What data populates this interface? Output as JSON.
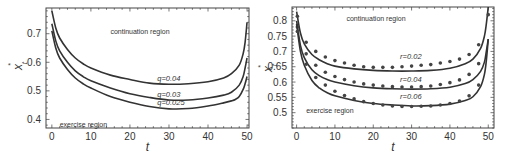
{
  "chart_data": [
    {
      "type": "line",
      "title": "",
      "xlabel": "t",
      "ylabel": "x_t^*",
      "xlim": [
        -1.5,
        50.5
      ],
      "ylim": [
        0.37,
        0.79
      ],
      "xticks": [
        0,
        10,
        20,
        30,
        40,
        50
      ],
      "yticks": [
        0.4,
        0.5,
        0.6,
        0.7
      ],
      "ytick_labels": [
        "0.4",
        "0.5",
        "0.6",
        "0.7"
      ],
      "xtick_labels": [
        "0",
        "10",
        "20",
        "30",
        "40",
        "50"
      ],
      "grid": false,
      "annotations": [
        {
          "text": "continuation region",
          "x": 15,
          "y": 0.7
        },
        {
          "text": "exercise region",
          "x": 2,
          "y": 0.375
        }
      ],
      "series": [
        {
          "name": "q=0.04",
          "label_pos": {
            "x": 27,
            "y": 0.535
          },
          "x": [
            0,
            1,
            2,
            4,
            6,
            8,
            10,
            15,
            20,
            25,
            30,
            35,
            40,
            44,
            46,
            48,
            49,
            49.5,
            50
          ],
          "values": [
            0.78,
            0.72,
            0.685,
            0.645,
            0.615,
            0.595,
            0.58,
            0.555,
            0.54,
            0.527,
            0.523,
            0.525,
            0.532,
            0.545,
            0.56,
            0.59,
            0.63,
            0.67,
            0.74
          ]
        },
        {
          "name": "q=0.03",
          "label_pos": {
            "x": 27,
            "y": 0.48
          },
          "x": [
            0,
            1,
            2,
            4,
            6,
            8,
            10,
            15,
            20,
            25,
            30,
            35,
            40,
            44,
            46,
            48,
            49,
            49.5,
            50
          ],
          "values": [
            0.735,
            0.675,
            0.64,
            0.6,
            0.57,
            0.55,
            0.535,
            0.51,
            0.49,
            0.477,
            0.468,
            0.468,
            0.475,
            0.485,
            0.495,
            0.52,
            0.55,
            0.58,
            0.615
          ]
        },
        {
          "name": "q=0.025",
          "label_pos": {
            "x": 27,
            "y": 0.452
          },
          "x": [
            0,
            1,
            2,
            4,
            6,
            8,
            10,
            15,
            20,
            25,
            30,
            35,
            40,
            44,
            46,
            47,
            48,
            49,
            49.5,
            50
          ],
          "values": [
            0.71,
            0.65,
            0.615,
            0.575,
            0.545,
            0.525,
            0.51,
            0.48,
            0.46,
            0.445,
            0.437,
            0.438,
            0.447,
            0.458,
            0.465,
            0.47,
            0.48,
            0.505,
            0.525,
            0.55
          ]
        }
      ]
    },
    {
      "type": "line",
      "title": "",
      "xlabel": "t",
      "ylabel": "x_t^*",
      "xlim": [
        -1.2,
        51.5
      ],
      "ylim": [
        0.45,
        0.845
      ],
      "xticks": [
        0,
        10,
        20,
        30,
        40,
        50
      ],
      "yticks": [
        0.5,
        0.55,
        0.6,
        0.65,
        0.7,
        0.75,
        0.8
      ],
      "ytick_labels": [
        "0.5",
        "0.55",
        "0.6",
        "0.65",
        "0.7",
        "0.75",
        "0.8"
      ],
      "xtick_labels": [
        "0",
        "10",
        "20",
        "30",
        "40",
        "50"
      ],
      "grid": false,
      "annotations": [
        {
          "text": "continuation region",
          "x": 13,
          "y": 0.8
        },
        {
          "text": "exercise region",
          "x": 2.5,
          "y": 0.5
        }
      ],
      "series": [
        {
          "name": "r=0.02",
          "label_pos": {
            "x": 27,
            "y": 0.675
          },
          "x": [
            0,
            1,
            2,
            4,
            6,
            8,
            10,
            15,
            20,
            25,
            30,
            35,
            40,
            44,
            46,
            48,
            49,
            49.5,
            50
          ],
          "values": [
            0.83,
            0.76,
            0.725,
            0.69,
            0.672,
            0.66,
            0.652,
            0.643,
            0.638,
            0.636,
            0.636,
            0.638,
            0.645,
            0.66,
            0.675,
            0.71,
            0.75,
            0.79,
            0.845
          ],
          "markers_x": [
            0.2,
            2.5,
            5,
            7.5,
            10,
            12.5,
            15,
            17.5,
            20,
            22.5,
            25,
            27.5,
            30,
            32.5,
            35,
            37.5,
            40,
            42.5,
            45,
            47.5,
            50
          ],
          "markers_y": [
            0.815,
            0.73,
            0.7,
            0.682,
            0.67,
            0.662,
            0.655,
            0.65,
            0.648,
            0.648,
            0.648,
            0.65,
            0.652,
            0.655,
            0.657,
            0.662,
            0.667,
            0.675,
            0.69,
            0.722,
            0.82
          ]
        },
        {
          "name": "r=0.04",
          "label_pos": {
            "x": 27,
            "y": 0.6
          },
          "x": [
            0,
            1,
            2,
            4,
            6,
            8,
            10,
            15,
            20,
            25,
            30,
            35,
            40,
            44,
            46,
            48,
            49,
            49.5,
            50
          ],
          "values": [
            0.8,
            0.72,
            0.68,
            0.64,
            0.62,
            0.608,
            0.6,
            0.588,
            0.581,
            0.578,
            0.577,
            0.578,
            0.583,
            0.595,
            0.608,
            0.635,
            0.665,
            0.7,
            0.74
          ],
          "markers_x": [
            0.2,
            2.5,
            5,
            7.5,
            10,
            12.5,
            15,
            17.5,
            20,
            22.5,
            25,
            27.5,
            30,
            32.5,
            35,
            37.5,
            40,
            42.5,
            45,
            47.5
          ],
          "markers_y": [
            0.78,
            0.692,
            0.655,
            0.632,
            0.618,
            0.608,
            0.6,
            0.594,
            0.59,
            0.587,
            0.585,
            0.584,
            0.584,
            0.585,
            0.587,
            0.592,
            0.598,
            0.607,
            0.625,
            0.66
          ]
        },
        {
          "name": "r=0.06",
          "label_pos": {
            "x": 27,
            "y": 0.545
          },
          "x": [
            0,
            1,
            2,
            4,
            6,
            8,
            10,
            15,
            20,
            25,
            30,
            35,
            40,
            44,
            46,
            48,
            49,
            49.5,
            50
          ],
          "values": [
            0.79,
            0.7,
            0.655,
            0.605,
            0.58,
            0.565,
            0.555,
            0.54,
            0.53,
            0.525,
            0.522,
            0.523,
            0.528,
            0.54,
            0.552,
            0.585,
            0.625,
            0.67,
            0.74
          ],
          "markers_x": [
            0.2,
            2.5,
            5,
            7.5,
            10,
            12.5,
            15,
            17.5,
            20,
            22.5,
            25,
            27.5,
            30,
            32.5,
            35,
            37.5,
            40,
            42.5,
            45,
            47.5
          ],
          "markers_y": [
            0.765,
            0.658,
            0.615,
            0.59,
            0.57,
            0.556,
            0.545,
            0.536,
            0.53,
            0.525,
            0.522,
            0.52,
            0.52,
            0.521,
            0.522,
            0.525,
            0.53,
            0.538,
            0.555,
            0.59
          ]
        }
      ]
    }
  ],
  "panels": [
    {
      "frame": {
        "left": 46,
        "top": 8,
        "right": 249,
        "bottom": 128
      },
      "ylabel_x": 22,
      "ylabel_y": 66,
      "xlabel_y": 151
    },
    {
      "frame": {
        "left": 292,
        "top": 7,
        "right": 494,
        "bottom": 128
      },
      "ylabel_x": 272,
      "ylabel_y": 68,
      "xlabel_y": 151
    }
  ]
}
